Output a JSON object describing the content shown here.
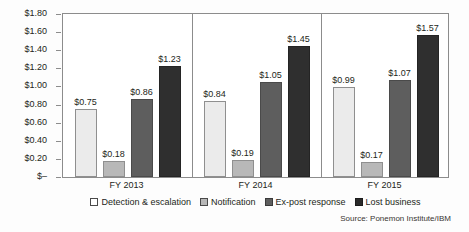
{
  "chart_data": {
    "type": "bar",
    "title": "",
    "subtitle": "",
    "xlabel": "",
    "ylabel": "",
    "categories": [
      "FY 2013",
      "FY 2014",
      "FY 2015"
    ],
    "series": [
      {
        "name": "Detection & escalation",
        "values": [
          0.75,
          0.84,
          0.99
        ],
        "labels": [
          "$0.75",
          "$0.84",
          "$0.99"
        ],
        "color": "#ebebeb"
      },
      {
        "name": "Notification",
        "values": [
          0.18,
          0.19,
          0.17
        ],
        "labels": [
          "$0.18",
          "$0.19",
          "$0.17"
        ],
        "color": "#b8b8b8"
      },
      {
        "name": "Ex-post response",
        "values": [
          0.86,
          1.05,
          1.07
        ],
        "labels": [
          "$0.86",
          "$1.05",
          "$1.07"
        ],
        "color": "#5e5e5e"
      },
      {
        "name": "Lost business",
        "values": [
          1.23,
          1.45,
          1.57
        ],
        "labels": [
          "$1.23",
          "$1.45",
          "$1.57"
        ],
        "color": "#2f2f2f"
      }
    ],
    "ylim": [
      0,
      1.8
    ],
    "ytick_values": [
      0,
      0.2,
      0.4,
      0.6,
      0.8,
      1.0,
      1.2,
      1.4,
      1.6,
      1.8
    ],
    "ytick_labels": [
      "$–",
      "$0.20",
      "$0.40",
      "$0.60",
      "$0.80",
      "$1.00",
      "$1.20",
      "$1.40",
      "$1.60",
      "$1.80"
    ],
    "grid": false,
    "legend_position": "bottom",
    "data_labels": true,
    "group_dividers": true
  },
  "legend": {
    "items": [
      {
        "label": "Detection & escalation"
      },
      {
        "label": "Notification"
      },
      {
        "label": "Ex-post response"
      },
      {
        "label": "Lost business"
      }
    ]
  },
  "source": {
    "text": "Source: Ponemon Institute/IBM"
  }
}
